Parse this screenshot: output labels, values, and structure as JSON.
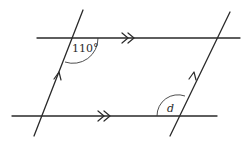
{
  "diagram": {
    "type": "parallel-lines-transversals",
    "angles": {
      "known": {
        "label": "110°",
        "value": 110,
        "position": "top-left intersection, below top line, right of left transversal"
      },
      "unknown": {
        "label": "d",
        "position": "bottom-right intersection, above bottom line, left of right transversal"
      }
    },
    "markings": {
      "horizontal_parallel": "double arrowheads (>>)",
      "slanted_parallel": "single arrowheads (>)"
    },
    "lines": {
      "top_horizontal": {
        "x1": 37,
        "y1": 38,
        "x2": 240,
        "y2": 38
      },
      "bottom_horizontal": {
        "x1": 12,
        "y1": 116,
        "x2": 217,
        "y2": 116
      },
      "left_transversal": {
        "x1": 83,
        "y1": 10,
        "x2": 34,
        "y2": 136
      },
      "right_transversal": {
        "x1": 230,
        "y1": 12,
        "x2": 170,
        "y2": 136
      }
    },
    "color": "#2a2a2a"
  }
}
